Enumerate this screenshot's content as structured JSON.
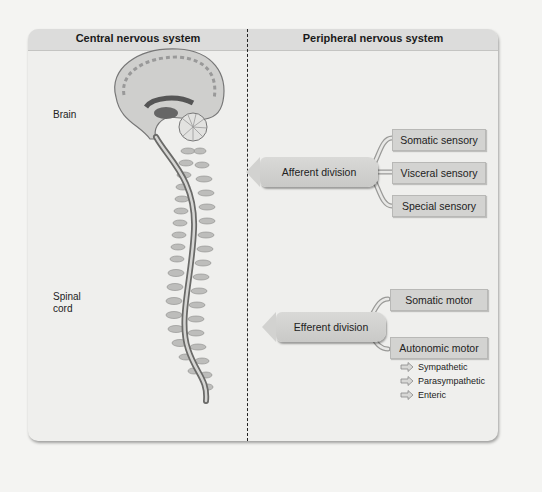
{
  "diagram": {
    "headers": {
      "cns": "Central nervous system",
      "pns": "Peripheral nervous system"
    },
    "cns_labels": {
      "brain": "Brain",
      "spinal_cord_line1": "Spinal",
      "spinal_cord_line2": "cord"
    },
    "afferent": {
      "label": "Afferent division",
      "targets": [
        "Somatic sensory",
        "Visceral sensory",
        "Special sensory"
      ]
    },
    "efferent": {
      "label": "Efferent division",
      "targets": [
        "Somatic motor",
        "Autonomic motor"
      ],
      "autonomic_subdivisions": [
        "Sympathetic",
        "Parasympathetic",
        "Enteric"
      ]
    },
    "colors": {
      "panel": "#efefed",
      "header": "#dcdcdb",
      "box": "#d3d3d1",
      "divider": "#222222"
    }
  }
}
